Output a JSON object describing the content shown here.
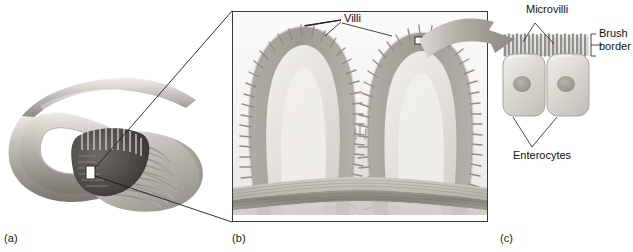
{
  "figure": {
    "background_color": "#ffffff",
    "ink_color": "#111111",
    "width": 633,
    "height": 252
  },
  "panels": [
    {
      "key": "a",
      "caption": "(a)",
      "name": "gross-small-intestine",
      "description": "Looped segment of small intestine cut open to reveal circular folds lined with villi",
      "callout_box": "small square region on the cut mucosal surface expanded into panel (b)"
    },
    {
      "key": "b",
      "caption": "(b)",
      "name": "villi-cross-section",
      "description": "Light micrograph-style cross section of intestinal mucosa showing two finger-like villi above submucosa and muscle layers",
      "callout_box": "small square on the epithelium of the right villus expanded into panel (c)"
    },
    {
      "key": "c",
      "caption": "(c)",
      "name": "enterocytes-detail",
      "description": "Two adjacent enterocytes with nuclei, capped by a dense fringe of microvilli forming the brush border"
    }
  ],
  "labels": {
    "villi": "Villi",
    "microvilli": "Microvilli",
    "brush_border_line1": "Brush",
    "brush_border_line2": "border",
    "enterocytes": "Enterocytes"
  },
  "colors": {
    "line": "#1b1b1b",
    "frame": "#3a3a3a",
    "arrow_gray": "#9a9a9a",
    "tissue_light": "#eceae6",
    "tissue_mid": "#bdbab4",
    "tissue_dark": "#8c8983",
    "muscle": "#8f8d88",
    "cell_body": "#d8d6cf",
    "nucleus": "#a5a29a",
    "organ_gray": "#a9a6a0"
  },
  "structures": {
    "panel_b_layers": [
      "villus epithelium with microvilli fringe",
      "lamina propria core",
      "submucosa",
      "muscularis (circular and longitudinal)"
    ],
    "panel_c_parts": [
      "microvilli",
      "brush border bracket",
      "enterocyte cell bodies",
      "nuclei"
    ]
  }
}
